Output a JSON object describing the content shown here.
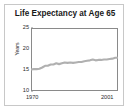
{
  "chart_data": {
    "type": "line",
    "title": "Life Expectancy at Age 65",
    "xlabel": "",
    "ylabel": "Years",
    "xlim": [
      1970,
      2001
    ],
    "ylim": [
      10,
      25
    ],
    "yticks": [
      25,
      20,
      15,
      10
    ],
    "xticks": [
      1970,
      2001
    ],
    "xtick_labels": [
      "1970",
      "2001"
    ],
    "grid": false,
    "legend": false,
    "line_color": "#b0b0b0",
    "series": [
      {
        "name": "Life expectancy at age 65",
        "x": [
          1970,
          1971,
          1972,
          1973,
          1974,
          1975,
          1976,
          1977,
          1978,
          1979,
          1980,
          1981,
          1982,
          1983,
          1984,
          1985,
          1986,
          1987,
          1988,
          1989,
          1990,
          1991,
          1992,
          1993,
          1994,
          1995,
          1996,
          1997,
          1998,
          1999,
          2000,
          2001
        ],
        "values": [
          15.1,
          15.2,
          15.2,
          15.3,
          15.6,
          16.0,
          16.0,
          16.3,
          16.3,
          16.6,
          16.4,
          16.6,
          16.8,
          16.7,
          16.8,
          16.7,
          16.8,
          16.9,
          16.9,
          17.1,
          17.2,
          17.3,
          17.5,
          17.3,
          17.4,
          17.4,
          17.5,
          17.5,
          17.6,
          17.7,
          17.9,
          17.9
        ]
      }
    ]
  },
  "yticks": {
    "t0": "25",
    "t1": "20",
    "t2": "15",
    "t3": "10"
  },
  "xticks": {
    "start": "1970",
    "end": "2001"
  },
  "axis": {
    "ylabel": "Years"
  },
  "title": {
    "text": "Life Expectancy at Age 65"
  }
}
